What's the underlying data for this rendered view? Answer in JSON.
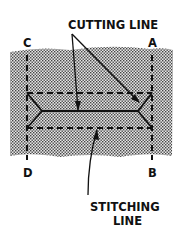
{
  "diagram": {
    "labels": {
      "cutting_line": "CUTTING LINE",
      "stitching_line_1": "STITCHING",
      "stitching_line_2": "LINE",
      "corner_c": "C",
      "corner_a": "A",
      "corner_d": "D",
      "corner_b": "B"
    },
    "colors": {
      "ink": "#111111",
      "stipple_bg": "#bdbdbd",
      "paper": "#ffffff"
    }
  }
}
